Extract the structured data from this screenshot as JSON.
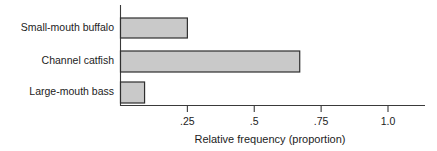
{
  "chart_data": {
    "type": "bar",
    "orientation": "horizontal",
    "title": "",
    "xlabel": "Relative frequency (proportion)",
    "ylabel": "",
    "categories": [
      "Small-mouth buffalo",
      "Channel catfish",
      "Large-mouth bass"
    ],
    "values": [
      0.25,
      0.67,
      0.09
    ],
    "xlim": [
      0,
      1.1
    ],
    "xticks": [
      0.25,
      0.5,
      0.75,
      1.0
    ],
    "xtick_labels": [
      ".25",
      ".5",
      ".75",
      "1.0"
    ],
    "grid": false,
    "legend": null,
    "colors": {
      "bar_fill": "#c9c9c9",
      "bar_stroke": "#2e2e2e",
      "axis": "#3a3a3a",
      "text": "#1c1c1c",
      "background": "#ffffff"
    }
  },
  "axis": {
    "x_title": "Relative frequency (proportion)",
    "tick_0": ".25",
    "tick_1": ".5",
    "tick_2": ".75",
    "tick_3": "1.0"
  },
  "bars": [
    {
      "label": "Small-mouth buffalo",
      "value": 0.25
    },
    {
      "label": "Channel catfish",
      "value": 0.67
    },
    {
      "label": "Large-mouth bass",
      "value": 0.09
    }
  ]
}
